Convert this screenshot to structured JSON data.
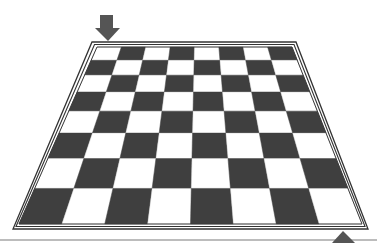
{
  "board": {
    "rows": 8,
    "cols": 8,
    "top_left_square": "light",
    "light_color": "#ffffff",
    "dark_color": "#3f3f3f",
    "grid_line_color": "#3a3a3a",
    "inner_corners": {
      "top_left": [
        97,
        47
      ],
      "top_right": [
        292,
        47
      ],
      "bottom_right": [
        362,
        224
      ],
      "bottom_left": [
        19,
        224
      ]
    },
    "frame": {
      "outer_corners": {
        "top_left": [
          92,
          42
        ],
        "top_right": [
          296,
          42
        ],
        "bottom_right": [
          368,
          229
        ],
        "bottom_left": [
          13,
          229
        ]
      },
      "middle_corners": {
        "top_left": [
          94.5,
          44.5
        ],
        "top_right": [
          294,
          44.5
        ],
        "bottom_right": [
          365,
          226.5
        ],
        "bottom_left": [
          16,
          226.5
        ]
      },
      "line_color": "#333333"
    }
  },
  "markers": {
    "top_arrow": {
      "direction": "down",
      "color": "#555555",
      "shaft": {
        "x": 100,
        "y": 15,
        "w": 13,
        "h": 13
      },
      "head": {
        "left": 95,
        "right": 120,
        "base_y": 28,
        "tip": [
          108,
          41
        ]
      }
    },
    "bottom_arrow": {
      "direction": "up",
      "color": "#555555",
      "tip": [
        343,
        231
      ],
      "left": 332,
      "right": 355,
      "base_y": 243
    }
  },
  "baseline": {
    "y": 240,
    "x1": 0,
    "x2": 377,
    "color": "#7a7a7a"
  }
}
